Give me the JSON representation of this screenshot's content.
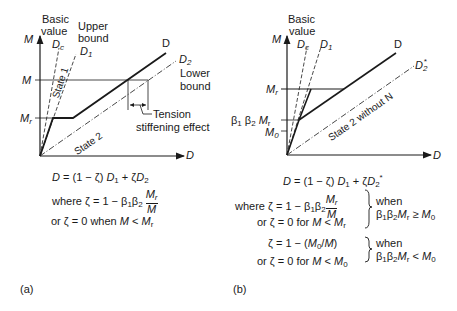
{
  "panel_a": {
    "caption": "(a)",
    "axis_y": "M",
    "axis_x": "D",
    "labels": {
      "basic_value_1": "Basic",
      "basic_value_2": "value",
      "dc": "Dc",
      "upper_bound_1": "Upper",
      "upper_bound_2": "bound",
      "d1": "D1",
      "d": "D",
      "d2": "D2",
      "lower_bound_1": "Lower",
      "lower_bound_2": "bound",
      "m_level": "M",
      "mr_level": "Mr",
      "state1": "State 1",
      "state2": "State 2",
      "tension_1": "Tension",
      "tension_2": "stiffening effect"
    },
    "equations": {
      "main": "D = (1 − ζ) D1 + ζ D2",
      "where": "where ζ = 1 − β1β2 Mr/M",
      "or": "or ζ = 0 when M < Mr"
    }
  },
  "panel_b": {
    "caption": "(b)",
    "axis_y": "M",
    "axis_x": "D",
    "labels": {
      "basic_value_1": "Basic",
      "basic_value_2": "value",
      "dc": "Dc",
      "d1": "D1",
      "d": "D",
      "d2star": "D2*",
      "mr_level": "Mr",
      "b1b2mr_level": "β1 β2 Mr",
      "m0_level": "M0",
      "state2": "State 2 without N"
    },
    "equations": {
      "main": "D = (1 − ζ) D1 + ζ D2*",
      "case1_line1": "where ζ = 1 − β1β2 Mr/M",
      "case1_line2": "or ζ = 0 for M < Mr",
      "case1_cond_1": "when",
      "case1_cond_2": "β1β2Mr ≥ M0",
      "case2_line1": "ζ = 1 − (M0/M)",
      "case2_line2": "or ζ = 0 for M < M0",
      "case2_cond_1": "when",
      "case2_cond_2": "β1β2Mr < M0"
    }
  }
}
